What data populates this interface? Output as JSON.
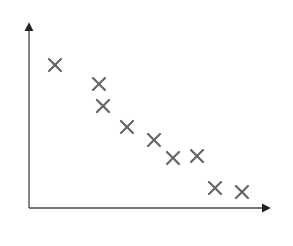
{
  "chart_data": {
    "type": "scatter",
    "title": "",
    "xlabel": "",
    "ylabel": "",
    "grid": false,
    "legend": null,
    "marker": "x",
    "marker_color": "#666666",
    "axis_color": "#222222",
    "xlim": [
      0,
      24
    ],
    "ylim": [
      0,
      18.5
    ],
    "x_ticks": [],
    "y_ticks": [],
    "series": [
      {
        "name": "",
        "points": [
          {
            "x": 2.6,
            "y": 14.3
          },
          {
            "x": 7.0,
            "y": 12.4
          },
          {
            "x": 7.4,
            "y": 10.2
          },
          {
            "x": 9.8,
            "y": 8.1
          },
          {
            "x": 12.5,
            "y": 6.8
          },
          {
            "x": 14.4,
            "y": 5.0
          },
          {
            "x": 16.8,
            "y": 5.2
          },
          {
            "x": 18.6,
            "y": 2.0
          },
          {
            "x": 21.3,
            "y": 1.6
          }
        ]
      }
    ],
    "trend": "negative correlation"
  }
}
